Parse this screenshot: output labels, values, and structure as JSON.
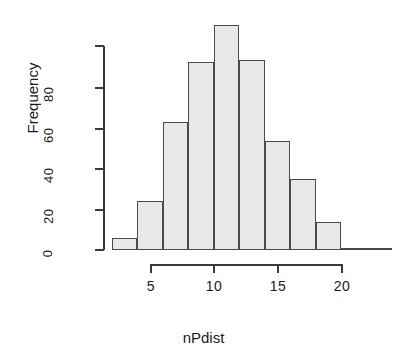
{
  "chart_data": {
    "type": "bar",
    "title": "",
    "subtitle": "",
    "xlabel": "nPdist",
    "ylabel": "Frequency",
    "grid": false,
    "legend": null,
    "legend_position": "none",
    "bin_width": 2,
    "bin_edges": [
      2,
      4,
      6,
      8,
      10,
      12,
      14,
      16,
      18,
      20,
      22,
      24
    ],
    "bin_labels": [
      "2-4",
      "4-6",
      "6-8",
      "8-10",
      "10-12",
      "12-14",
      "14-16",
      "16-18",
      "18-20",
      "20-22",
      "22-24"
    ],
    "categories": [
      "2-4",
      "4-6",
      "6-8",
      "8-10",
      "10-12",
      "12-14",
      "14-16",
      "16-18",
      "18-20",
      "20-22",
      "22-24"
    ],
    "values": [
      6,
      24,
      63,
      93,
      111,
      94,
      54,
      35,
      14,
      1,
      1
    ],
    "xlim": [
      2,
      24
    ],
    "ylim": [
      0,
      111
    ],
    "xticks": [
      5,
      10,
      15,
      20
    ],
    "xtick_labels": [
      "5",
      "10",
      "15",
      "20"
    ],
    "yticks": [
      0,
      20,
      40,
      60,
      80
    ],
    "ytick_labels": [
      "0",
      "20",
      "40",
      "60",
      "80"
    ],
    "bar_fill_color": "#e9e9e9",
    "bar_border_color": "#4a4a4a",
    "axis_color": "#3a3a3a",
    "text_color": "#1a1a1a",
    "background_color": "#ffffff"
  }
}
